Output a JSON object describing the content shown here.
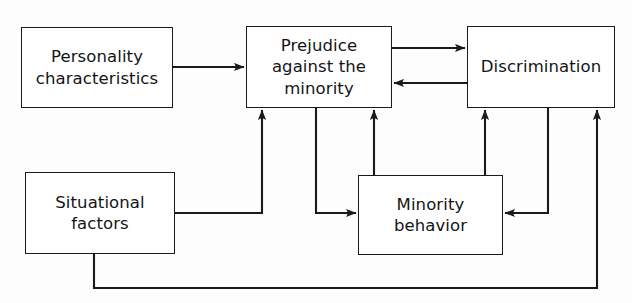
{
  "diagram": {
    "type": "flow-diagram",
    "title": "",
    "background_color": "#fdfdfd",
    "line_color": "#1a1a1a",
    "text_color": "#141414",
    "nodes": [
      {
        "id": "personality",
        "label": "Personality\ncharacteristics"
      },
      {
        "id": "prejudice",
        "label": "Prejudice\nagainst the\nminority"
      },
      {
        "id": "discrimination",
        "label": "Discrimination"
      },
      {
        "id": "situational",
        "label": "Situational\nfactors"
      },
      {
        "id": "minority",
        "label": "Minority\nbehavior"
      }
    ],
    "edges": [
      {
        "from": "personality",
        "to": "prejudice",
        "arrow": "single"
      },
      {
        "from": "prejudice",
        "to": "discrimination",
        "arrow": "single"
      },
      {
        "from": "discrimination",
        "to": "prejudice",
        "arrow": "single"
      },
      {
        "from": "situational",
        "to": "prejudice",
        "arrow": "single"
      },
      {
        "from": "situational",
        "to": "prejudice",
        "arrow": "single"
      },
      {
        "from": "minority",
        "to": "prejudice",
        "arrow": "single"
      },
      {
        "from": "minority",
        "to": "discrimination",
        "arrow": "single"
      },
      {
        "from": "discrimination",
        "to": "minority",
        "arrow": "single"
      },
      {
        "from": "situational",
        "to": "discrimination",
        "arrow": "single"
      }
    ]
  }
}
